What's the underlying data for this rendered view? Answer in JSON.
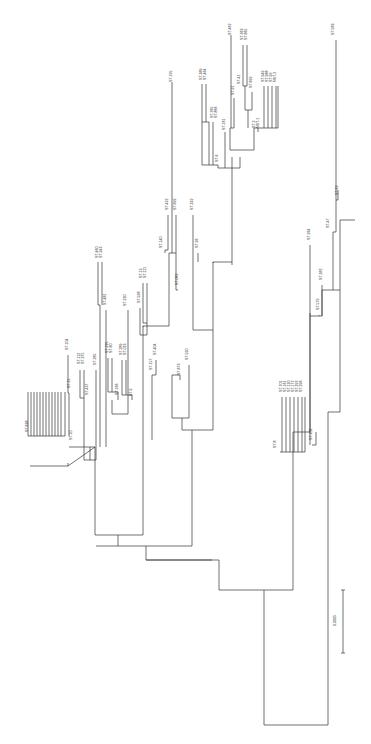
{
  "figure": {
    "type": "phylogenetic-tree",
    "orientation": "rotated-90-ccw",
    "scale_bar_label": "0.0005",
    "line_color": "#333333",
    "background": "#ffffff"
  },
  "branches": [
    [
      264,
      725,
      328,
      725
    ],
    [
      264,
      725,
      264,
      590
    ],
    [
      328,
      725,
      328,
      412
    ],
    [
      264,
      590,
      219,
      590
    ],
    [
      219,
      590,
      219,
      560
    ],
    [
      264,
      590,
      293,
      590
    ],
    [
      293,
      590,
      293,
      432
    ],
    [
      219,
      560,
      146,
      560
    ],
    [
      146,
      560,
      146,
      546
    ],
    [
      146,
      560,
      212,
      560
    ],
    [
      146,
      546,
      118,
      546
    ],
    [
      118,
      546,
      118,
      535
    ],
    [
      118,
      535,
      95,
      535
    ],
    [
      95,
      535,
      95,
      447
    ],
    [
      95,
      447,
      69,
      447
    ],
    [
      95,
      447,
      68,
      466
    ],
    [
      118,
      546,
      96,
      546
    ],
    [
      68,
      466,
      30,
      466
    ],
    [
      68,
      466,
      68,
      463
    ],
    [
      118,
      535,
      143,
      535
    ],
    [
      143,
      535,
      143,
      326
    ],
    [
      143,
      326,
      169,
      326
    ],
    [
      143,
      326,
      143,
      327
    ],
    [
      146,
      546,
      192,
      546
    ],
    [
      192,
      546,
      192,
      430
    ],
    [
      192,
      430,
      182,
      430
    ],
    [
      182,
      430,
      182,
      418
    ],
    [
      182,
      418,
      172,
      418
    ],
    [
      182,
      418,
      189,
      418
    ],
    [
      192,
      430,
      213,
      430
    ],
    [
      213,
      430,
      213,
      262
    ],
    [
      213,
      262,
      232,
      262
    ],
    [
      213,
      262,
      213,
      263
    ],
    [
      232,
      262,
      232,
      157
    ],
    [
      232,
      262,
      232,
      265
    ],
    [
      293,
      432,
      310,
      432
    ],
    [
      310,
      432,
      310,
      316
    ],
    [
      310,
      316,
      322,
      316
    ],
    [
      322,
      316,
      322,
      290
    ],
    [
      322,
      290,
      340,
      290
    ],
    [
      310,
      316,
      310,
      313
    ],
    [
      328,
      412,
      340,
      412
    ],
    [
      340,
      412,
      340,
      220
    ],
    [
      340,
      220,
      355,
      220
    ]
  ],
  "labels": [
    {
      "text": "ST-638",
      "x": 28,
      "y": 432
    },
    {
      "text": "ST-10",
      "x": 72,
      "y": 440
    },
    {
      "text": "ST-15",
      "x": 70,
      "y": 388
    },
    {
      "text": "ST-104",
      "x": 68,
      "y": 350
    },
    {
      "text": "ST-112",
      "x": 80,
      "y": 364
    },
    {
      "text": "ST-375",
      "x": 84,
      "y": 364
    },
    {
      "text": "ST-437",
      "x": 88,
      "y": 395
    },
    {
      "text": "ST-265",
      "x": 96,
      "y": 365
    },
    {
      "text": "ST-481",
      "x": 106,
      "y": 305
    },
    {
      "text": "ST-460",
      "x": 98,
      "y": 258
    },
    {
      "text": "ST-343",
      "x": 102,
      "y": 258
    },
    {
      "text": "ST-225",
      "x": 108,
      "y": 353
    },
    {
      "text": "ST-60",
      "x": 112,
      "y": 353
    },
    {
      "text": "ST-166",
      "x": 118,
      "y": 395
    },
    {
      "text": "ST-289",
      "x": 122,
      "y": 355
    },
    {
      "text": "ST-023",
      "x": 126,
      "y": 355
    },
    {
      "text": "ST-9",
      "x": 132,
      "y": 396
    },
    {
      "text": "ST-230",
      "x": 126,
      "y": 306
    },
    {
      "text": "ST-598",
      "x": 140,
      "y": 303
    },
    {
      "text": "ST-13",
      "x": 142,
      "y": 278
    },
    {
      "text": "ST-111",
      "x": 146,
      "y": 278
    },
    {
      "text": "ST-157",
      "x": 152,
      "y": 370
    },
    {
      "text": "ST-404",
      "x": 156,
      "y": 355
    },
    {
      "text": "ST-140",
      "x": 162,
      "y": 248
    },
    {
      "text": "ST-432",
      "x": 168,
      "y": 210
    },
    {
      "text": "ST-699",
      "x": 176,
      "y": 210
    },
    {
      "text": "ST-062",
      "x": 178,
      "y": 285
    },
    {
      "text": "ST-673",
      "x": 180,
      "y": 375
    },
    {
      "text": "ST-590",
      "x": 188,
      "y": 360
    },
    {
      "text": "ST-332",
      "x": 193,
      "y": 210
    },
    {
      "text": "ST-36",
      "x": 198,
      "y": 248
    },
    {
      "text": "ST-195",
      "x": 172,
      "y": 82
    },
    {
      "text": "ST-389",
      "x": 202,
      "y": 80
    },
    {
      "text": "ST-464",
      "x": 206,
      "y": 80
    },
    {
      "text": "ST-265",
      "x": 213,
      "y": 118
    },
    {
      "text": "ST-866",
      "x": 217,
      "y": 118
    },
    {
      "text": "ST-161",
      "x": 225,
      "y": 130
    },
    {
      "text": "ST-6",
      "x": 218,
      "y": 162
    },
    {
      "text": "ST-91",
      "x": 234,
      "y": 95
    },
    {
      "text": "ST-41",
      "x": 240,
      "y": 84
    },
    {
      "text": "ST-462",
      "x": 231,
      "y": 35
    },
    {
      "text": "ST-363",
      "x": 243,
      "y": 40
    },
    {
      "text": "ST-865",
      "x": 247,
      "y": 40
    },
    {
      "text": "ST-699",
      "x": 252,
      "y": 88
    },
    {
      "text": "ST-949",
      "x": 264,
      "y": 82
    },
    {
      "text": "ST-988",
      "x": 268,
      "y": 82
    },
    {
      "text": "ST-99",
      "x": 272,
      "y": 82
    },
    {
      "text": "NST-2",
      "x": 276,
      "y": 82
    },
    {
      "text": "ST-2",
      "x": 255,
      "y": 128
    },
    {
      "text": "NST-1",
      "x": 259,
      "y": 128
    },
    {
      "text": "ST-583",
      "x": 334,
      "y": 35
    },
    {
      "text": "ST-63",
      "x": 338,
      "y": 195
    },
    {
      "text": "ST-47",
      "x": 329,
      "y": 228
    },
    {
      "text": "ST-264",
      "x": 310,
      "y": 240
    },
    {
      "text": "ST-382",
      "x": 322,
      "y": 280
    },
    {
      "text": "ST-579",
      "x": 319,
      "y": 310
    },
    {
      "text": "ST-205",
      "x": 312,
      "y": 440
    },
    {
      "text": "ST-8",
      "x": 276,
      "y": 448
    },
    {
      "text": "ST-701",
      "x": 282,
      "y": 392
    },
    {
      "text": "ST-161b",
      "x": 286,
      "y": 392
    },
    {
      "text": "ST-130",
      "x": 290,
      "y": 392
    },
    {
      "text": "ST-172",
      "x": 294,
      "y": 392
    },
    {
      "text": "ST-292",
      "x": 298,
      "y": 392
    },
    {
      "text": "ST-296",
      "x": 302,
      "y": 392
    }
  ]
}
